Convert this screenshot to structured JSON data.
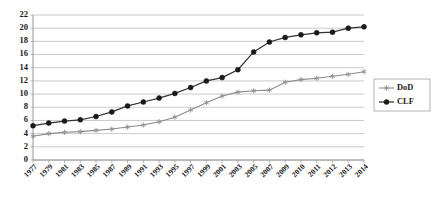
{
  "chart_data": {
    "type": "line",
    "title": "",
    "subtitle": "",
    "xlabel": "",
    "ylabel": "",
    "ylim": [
      0,
      22
    ],
    "ytick_step": 2,
    "yticks": [
      0,
      2,
      4,
      6,
      8,
      10,
      12,
      14,
      16,
      18,
      20,
      22
    ],
    "grid": true,
    "grid_axis": "y",
    "legend_position": "right",
    "x": [
      1977,
      1979,
      1981,
      1983,
      1985,
      1987,
      1989,
      1991,
      1993,
      1995,
      1997,
      1999,
      2001,
      2003,
      2005,
      2007,
      2009,
      2010,
      2011,
      2012,
      2013,
      2014
    ],
    "xtick_labels": [
      "1977",
      "1979",
      "1981",
      "1983",
      "1985",
      "1987",
      "1989",
      "1991",
      "1993",
      "1995",
      "1997",
      "1999",
      "2001",
      "2003",
      "2005",
      "2007",
      "2009",
      "2010",
      "2011",
      "2012",
      "2013",
      "2014"
    ],
    "series": [
      {
        "name": "DoD",
        "marker": "star",
        "color": "#8f8f8f",
        "values": [
          3.6,
          4.0,
          4.2,
          4.3,
          4.5,
          4.7,
          5.0,
          5.3,
          5.8,
          6.5,
          7.6,
          8.7,
          9.7,
          10.3,
          10.5,
          10.6,
          11.8,
          12.2,
          12.4,
          12.7,
          13.0,
          13.4
        ]
      },
      {
        "name": "CLF",
        "marker": "circle",
        "color": "#1a1a1a",
        "values": [
          5.2,
          5.6,
          5.9,
          6.1,
          6.6,
          7.3,
          8.2,
          8.8,
          9.4,
          10.1,
          11.0,
          12.0,
          12.5,
          13.7,
          16.4,
          17.9,
          18.6,
          19.0,
          19.3,
          19.4,
          20.0,
          20.2
        ]
      }
    ]
  },
  "legend": {
    "items": [
      {
        "label": "DoD"
      },
      {
        "label": "CLF"
      }
    ]
  }
}
